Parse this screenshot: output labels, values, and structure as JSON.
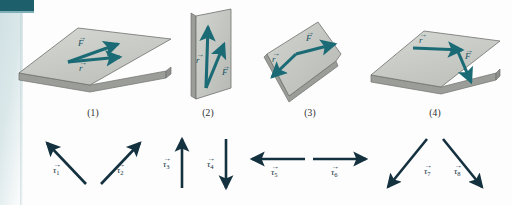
{
  "figure": {
    "background_color": "#fdfdfd",
    "arrow_color_vectors": "#1a6b75",
    "arrow_color_torque": "#14313f",
    "plate_fill_top": "#c9cbc6",
    "plate_fill_side": "#a7a9a4",
    "plate_stroke": "#6e716d",
    "edge_strip_color": "#cfe0e4",
    "corner_block_color": "#1d5f6b"
  },
  "panels": [
    {
      "id": "panel-1",
      "caption": "(1)",
      "surface": "horizontal-plate",
      "force_label": "F",
      "radius_label": "r",
      "force_direction": "up-right",
      "radius_direction": "right",
      "description": "Horizontal plate, r points right, F points up and to the right"
    },
    {
      "id": "panel-2",
      "caption": "(2)",
      "surface": "vertical-plate",
      "force_label": "F",
      "radius_label": "r",
      "force_direction": "up-right",
      "radius_direction": "up",
      "description": "Vertical plate, r points up, F points up and to the right"
    },
    {
      "id": "panel-3",
      "caption": "(3)",
      "surface": "tilted-plate",
      "force_label": "F",
      "radius_label": "r",
      "force_direction": "right",
      "radius_direction": "down-left",
      "description": "Tilted wedge plate, r points down-left, F points right"
    },
    {
      "id": "panel-4",
      "caption": "(4)",
      "surface": "horizontal-plate",
      "force_label": "F",
      "radius_label": "r",
      "force_direction": "down-right",
      "radius_direction": "right",
      "description": "Horizontal plate, r points right, F points down and to the right"
    }
  ],
  "torque_vectors": [
    {
      "id": "tau-1",
      "glyph": "τ",
      "subscript": "1",
      "direction": "up-left",
      "angle_deg": 135
    },
    {
      "id": "tau-2",
      "glyph": "τ",
      "subscript": "2",
      "direction": "up-right",
      "angle_deg": 45
    },
    {
      "id": "tau-3",
      "glyph": "τ",
      "subscript": "3",
      "direction": "up",
      "angle_deg": 90
    },
    {
      "id": "tau-4",
      "glyph": "τ",
      "subscript": "4",
      "direction": "down",
      "angle_deg": 270
    },
    {
      "id": "tau-5",
      "glyph": "τ",
      "subscript": "5",
      "direction": "left",
      "angle_deg": 180
    },
    {
      "id": "tau-6",
      "glyph": "τ",
      "subscript": "6",
      "direction": "right",
      "angle_deg": 0
    },
    {
      "id": "tau-7",
      "glyph": "τ",
      "subscript": "7",
      "direction": "down-left",
      "angle_deg": 215
    },
    {
      "id": "tau-8",
      "glyph": "τ",
      "subscript": "8",
      "direction": "down-right",
      "angle_deg": 325
    }
  ],
  "vector_arrow_glyph": "→"
}
